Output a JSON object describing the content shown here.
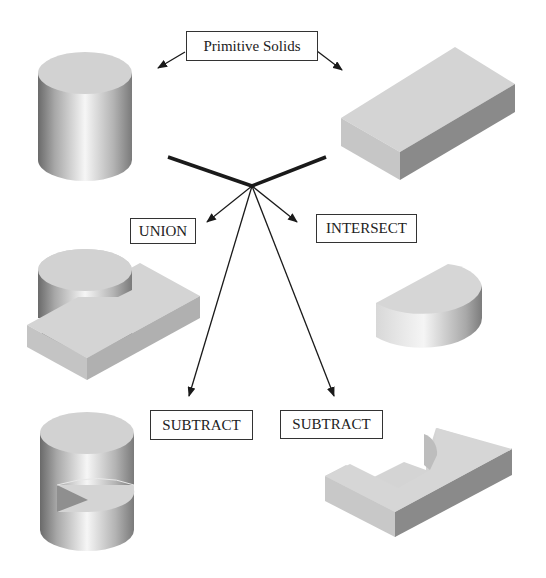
{
  "labels": {
    "primitive_solids": "Primitive Solids",
    "union": "UNION",
    "intersect": "INTERSECT",
    "subtract_left": "SUBTRACT",
    "subtract_right": "SUBTRACT"
  },
  "shapes": {
    "primitive_cylinder": "cylinder",
    "primitive_box": "rectangular block",
    "union_result": "cylinder united with block",
    "intersect_result": "half-cylinder (intersection)",
    "subtract_left_result": "cylinder minus block (notched cylinder)",
    "subtract_right_result": "block minus cylinder (block with semicircular cut)"
  },
  "colors": {
    "line": "#1a1a1a",
    "face_light": "#d6d6d6",
    "face_dark": "#8e8e8e",
    "background": "#ffffff"
  }
}
